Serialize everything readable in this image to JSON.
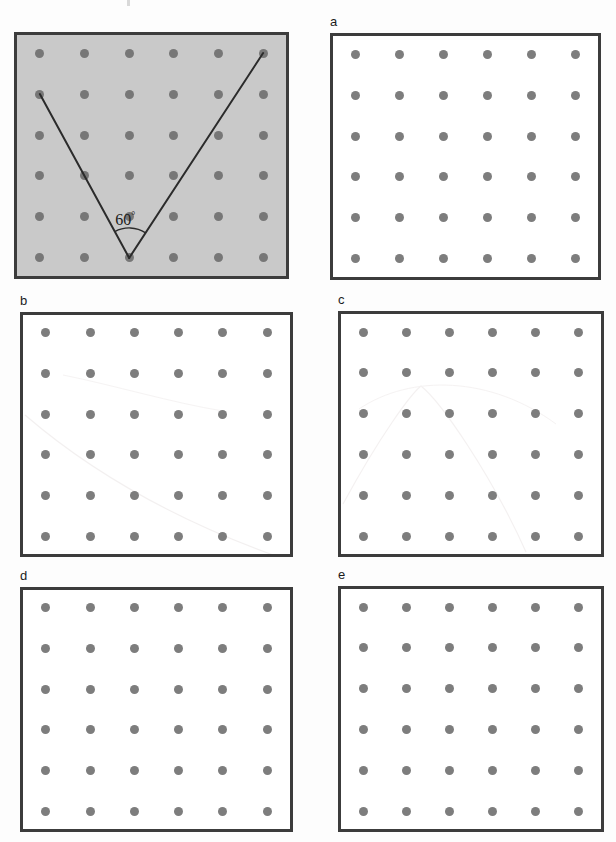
{
  "page": {
    "kind": "geometry-worksheet-figure",
    "background_color": "#fdfdfd",
    "width": 616,
    "height": 842
  },
  "style": {
    "panel_border_color": "#3c3c3c",
    "panel_border_width": 3,
    "panel_fill_plain": "#ffffff",
    "panel_fill_shaded": "#c9c9c9",
    "dot_color": "#7d7d7d",
    "dot_diameter": 9,
    "line_color": "#2b2b2b",
    "label_color": "#1b1b1b"
  },
  "grid": {
    "rows": 6,
    "cols": 6,
    "description": "6 by 6 square array of pegs (geoboard dots)"
  },
  "panels": [
    {
      "id": "question",
      "label": "",
      "shaded": true,
      "x": 14,
      "y": 32,
      "width": 275,
      "height": 247,
      "has_figure": true
    },
    {
      "id": "a",
      "label": "a",
      "shaded": false,
      "x": 330,
      "y": 33,
      "width": 271,
      "height": 247,
      "has_figure": false
    },
    {
      "id": "b",
      "label": "b",
      "shaded": false,
      "x": 20,
      "y": 312,
      "width": 273,
      "height": 245,
      "has_figure": false
    },
    {
      "id": "c",
      "label": "c",
      "shaded": false,
      "x": 338,
      "y": 311,
      "width": 266,
      "height": 246,
      "has_figure": false
    },
    {
      "id": "d",
      "label": "d",
      "shaded": false,
      "x": 20,
      "y": 587,
      "width": 273,
      "height": 245,
      "has_figure": false
    },
    {
      "id": "e",
      "label": "e",
      "shaded": false,
      "x": 338,
      "y": 586,
      "width": 266,
      "height": 246,
      "has_figure": false
    }
  ],
  "figure": {
    "type": "angle-on-geoboard",
    "angle_label": "60",
    "angle_degree_symbol": "°",
    "vertex_peg": {
      "col": 3,
      "row": 6
    },
    "ray_endpoints": [
      {
        "col": 1,
        "row": 2,
        "note": "left ray, passes through peg (2,3)"
      },
      {
        "col": 6,
        "row": 1,
        "note": "right ray, passes through peg (5,3)"
      }
    ],
    "arc_radius_px": 30,
    "arc_note": "small arc drawn between the two rays at the vertex"
  }
}
